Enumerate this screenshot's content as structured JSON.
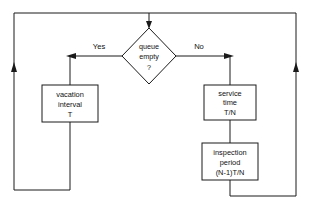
{
  "diagram": {
    "type": "flowchart",
    "background_color": "#ffffff",
    "line_color": "#1a1a1a",
    "text_color": "#111111",
    "nodes": [
      {
        "id": "decision",
        "shape": "diamond",
        "lines": [
          "queue",
          "empty",
          "?"
        ],
        "line1": "queue",
        "line2": "empty",
        "line3": "?"
      },
      {
        "id": "vacation",
        "shape": "rectangle",
        "lines": [
          "vacation",
          "interval",
          "T"
        ],
        "line1": "vacation",
        "line2": "interval",
        "line3": "T"
      },
      {
        "id": "service",
        "shape": "rectangle",
        "lines": [
          "service",
          "time",
          "T/N"
        ],
        "line1": "service",
        "line2": "time",
        "line3": "T/N"
      },
      {
        "id": "inspection",
        "shape": "rectangle",
        "lines": [
          "inspection",
          "period",
          "(N-1)T/N"
        ],
        "line1": "inspection",
        "line2": "period",
        "line3": "(N-1)T/N"
      }
    ],
    "edge_labels": {
      "yes": "Yes",
      "no": "No"
    }
  }
}
